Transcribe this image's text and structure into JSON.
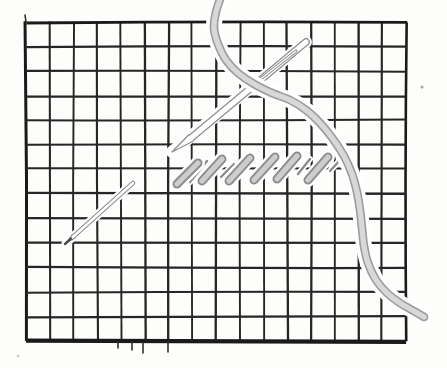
{
  "scene": {
    "description": "Hand-drawn illustration of needlepoint half-cross tent stitches on a canvas grid, with a threaded needle crossing from the top and a needle tip emerging at lower left",
    "width": 447,
    "height": 368,
    "background": "#fdfdfb"
  },
  "grid": {
    "x0": 26,
    "y0": 22,
    "x1": 406,
    "y1": 341,
    "cols": 16,
    "rows": 13,
    "line_color": "#262626",
    "border_color": "#1a1a1a",
    "inner_width": 2.1,
    "border_widths": {
      "top": 2.8,
      "right": 2.6,
      "bottom": 4.2,
      "left": 3.0
    },
    "overshoot_ticks": [
      [
        25,
        15,
        26,
        22
      ],
      [
        118,
        342,
        118,
        348
      ],
      [
        132,
        342,
        132,
        350
      ],
      [
        143,
        342,
        143,
        353
      ],
      [
        168,
        342,
        168,
        352
      ]
    ],
    "tick_color": "#2e2e2e",
    "tick_width": 1.6
  },
  "thread": {
    "points": [
      [
        222,
        -6
      ],
      [
        216,
        12
      ],
      [
        214,
        28
      ],
      [
        218,
        44
      ],
      [
        226,
        60
      ],
      [
        238,
        73
      ],
      [
        254,
        84
      ],
      [
        272,
        93
      ],
      [
        290,
        100
      ],
      [
        306,
        110
      ],
      [
        320,
        123
      ],
      [
        333,
        139
      ],
      [
        344,
        156
      ],
      [
        352,
        174
      ],
      [
        357,
        192
      ],
      [
        360,
        210
      ],
      [
        362,
        228
      ],
      [
        364,
        246
      ],
      [
        368,
        263
      ],
      [
        376,
        280
      ],
      [
        387,
        293
      ],
      [
        400,
        303
      ],
      [
        412,
        310
      ],
      [
        424,
        317
      ]
    ],
    "casing_color": "#ffffff",
    "casing_width": 16,
    "edge_color": "#9c9c9c",
    "width": 8.6,
    "fill_color": "#d8d8d8",
    "inner_width": 5.4
  },
  "needle": {
    "tip": [
      172,
      152
    ],
    "shaft_start": [
      191,
      138
    ],
    "end": [
      306,
      42
    ],
    "casing_color": "#ffffff",
    "casing_width": 12,
    "edge_color": "#8f8f8f",
    "width": 7.8,
    "fill_color": "#ffffff",
    "inner_width": 5.2,
    "eye": {
      "from": [
        253,
        85
      ],
      "to": [
        296,
        51
      ],
      "outer_width": 3.2,
      "inner_width": 1.2
    }
  },
  "small_needle": {
    "tip": [
      66,
      243
    ],
    "shaft_start": [
      74,
      236
    ],
    "end": [
      133,
      183
    ],
    "casing_color": "#ffffff",
    "casing_width": 9,
    "edge_color": "#909090",
    "width": 4.6,
    "fill_color": "#ffffff",
    "inner_width": 2.4,
    "tip_color": "#4a4a4a",
    "tip_width": 2.4,
    "tip_seg": [
      [
        65,
        244
      ],
      [
        71,
        238.6
      ]
    ]
  },
  "stitches": {
    "edge_color": "#8c8c8c",
    "width": 9,
    "fill_color": "#cdcdcd",
    "inner_width": 5.2,
    "casing_color": "#ffffff",
    "casing_width": 14,
    "capsules": [
      [
        177,
        184,
        198,
        163
      ],
      [
        202,
        181,
        222,
        159
      ],
      [
        229,
        181,
        250,
        158
      ],
      [
        254,
        180,
        275,
        157
      ],
      [
        277,
        179,
        297,
        156
      ],
      [
        308,
        180,
        328,
        157
      ]
    ],
    "connectors": [
      [
        190,
        182,
        207,
        161
      ],
      [
        221,
        177,
        234,
        164
      ],
      [
        298,
        174,
        310,
        159
      ],
      [
        330,
        171,
        342,
        158
      ]
    ],
    "connector_width": 2.4,
    "connector_casing_width": 6
  },
  "specks": [
    {
      "x": 422,
      "y": 87,
      "r": 1.6,
      "color": "#a8a8a8"
    },
    {
      "x": 18,
      "y": 356,
      "r": 1.3,
      "color": "#c9c9c9"
    }
  ]
}
